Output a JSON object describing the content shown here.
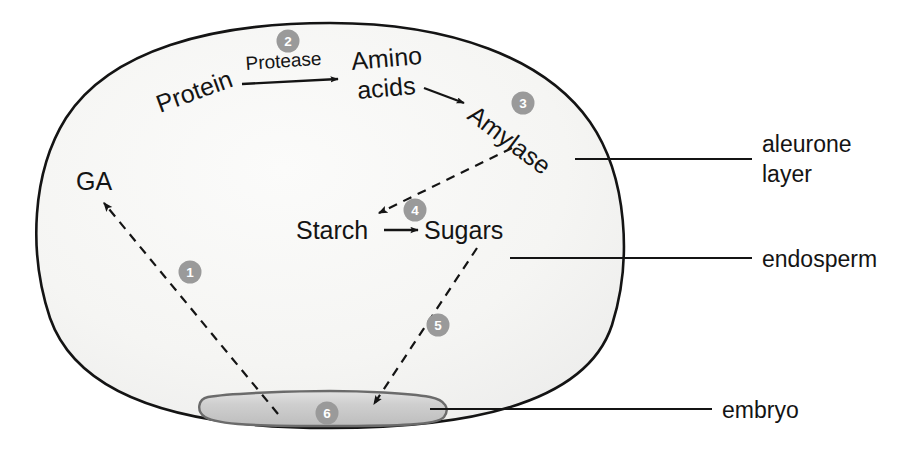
{
  "figure": {
    "seed_outline_color": "#1a1a1a",
    "endosperm_fill": "#f4f4f2",
    "embryo_fill": "#c9c9c9",
    "embryo_stroke": "#6b6b6b",
    "badge_color": "#9a9a9a",
    "badge_text_color": "#ffffff",
    "arrow_color": "#141414",
    "text_color": "#141414"
  },
  "molecules": {
    "ga": "GA",
    "protein": "Protein",
    "amino_acids_line1": "Amino",
    "amino_acids_line2": "acids",
    "amylase": "Amylase",
    "starch": "Starch",
    "sugars": "Sugars"
  },
  "enzymes": {
    "protease": "Protease"
  },
  "side_labels": {
    "aleurone_line1": "aleurone",
    "aleurone_line2": "layer",
    "endosperm": "endosperm",
    "embryo": "embryo"
  },
  "step_badges": [
    {
      "id": "badge-1",
      "number": "1",
      "x": 190,
      "y": 272,
      "describes": "GA travels from embryo to aleurone layer"
    },
    {
      "id": "badge-2",
      "number": "2",
      "x": 288,
      "y": 41,
      "describes": "Protease breaks protein into amino acids"
    },
    {
      "id": "badge-3",
      "number": "3",
      "x": 523,
      "y": 103,
      "describes": "Amino acids used to synthesise amylase"
    },
    {
      "id": "badge-4",
      "number": "4",
      "x": 415,
      "y": 210,
      "describes": "Amylase digests starch into sugars"
    },
    {
      "id": "badge-5",
      "number": "5",
      "x": 438,
      "y": 325,
      "describes": "Sugars move to the embryo"
    },
    {
      "id": "badge-6",
      "number": "6",
      "x": 327,
      "y": 413,
      "describes": "Embryo uses sugars for growth"
    }
  ],
  "chart_data": {
    "type": "diagram",
    "nodes": [
      {
        "name": "GA",
        "x": 96,
        "y": 180,
        "rotation": 0
      },
      {
        "name": "Protein",
        "x": 196,
        "y": 102,
        "rotation": -20
      },
      {
        "name": "Amino acids",
        "x": 392,
        "y": 68,
        "rotation": -8
      },
      {
        "name": "Amylase",
        "x": 502,
        "y": 130,
        "rotation": -38
      },
      {
        "name": "Starch",
        "x": 336,
        "y": 231,
        "rotation": 0
      },
      {
        "name": "Sugars",
        "x": 468,
        "y": 231,
        "rotation": 0
      },
      {
        "name": "embryo",
        "x": 320,
        "y": 410,
        "rotation": 0
      }
    ],
    "edges": [
      {
        "from": "embryo",
        "to": "GA",
        "style": "dashed",
        "step": "1",
        "label": ""
      },
      {
        "from": "Protein",
        "to": "Amino acids",
        "style": "solid",
        "step": "2",
        "label": "Protease"
      },
      {
        "from": "Amino acids",
        "to": "Amylase",
        "style": "solid",
        "step": "3",
        "label": ""
      },
      {
        "from": "Amylase",
        "to": "Starch",
        "style": "dashed",
        "step": "4",
        "label": ""
      },
      {
        "from": "Starch",
        "to": "Sugars",
        "style": "solid",
        "step": "4",
        "label": ""
      },
      {
        "from": "Sugars",
        "to": "embryo",
        "style": "dashed",
        "step": "5",
        "label": ""
      }
    ],
    "regions": [
      "aleurone layer",
      "endosperm",
      "embryo"
    ]
  }
}
